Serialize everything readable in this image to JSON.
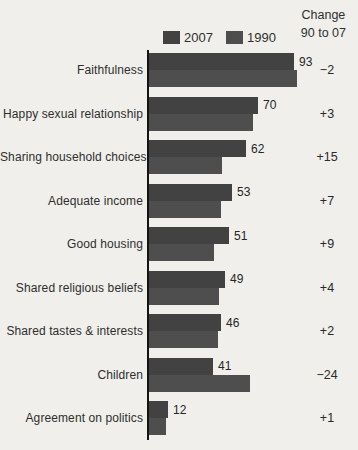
{
  "header": {
    "change_line1": "Change",
    "change_line2": "90 to 07"
  },
  "legend": [
    {
      "label": "2007"
    },
    {
      "label": "1990"
    }
  ],
  "chart_data": {
    "type": "bar",
    "orientation": "horizontal",
    "title": "",
    "xlabel": "",
    "ylabel": "",
    "xlim": [
      0,
      100
    ],
    "grid": false,
    "legend_position": "top",
    "categories": [
      "Faithfulness",
      "Happy sexual relationship",
      "Sharing household choices",
      "Adequate income",
      "Good housing",
      "Shared religious beliefs",
      "Shared tastes & interests",
      "Children",
      "Agreement on politics"
    ],
    "series": [
      {
        "name": "2007",
        "values": [
          93,
          70,
          62,
          53,
          51,
          49,
          46,
          41,
          12
        ]
      },
      {
        "name": "1990",
        "values": [
          95,
          67,
          47,
          46,
          42,
          45,
          44,
          65,
          11
        ]
      }
    ],
    "value_labels": [
      "93",
      "70",
      "62",
      "53",
      "51",
      "49",
      "46",
      "41",
      "12"
    ],
    "change_labels": [
      "−2",
      "+3",
      "+15",
      "+7",
      "+9",
      "+4",
      "+2",
      "−24",
      "+1"
    ],
    "colors": {
      "2007": "#424242",
      "1990": "#4e4e4e",
      "axis": "#141414"
    }
  }
}
